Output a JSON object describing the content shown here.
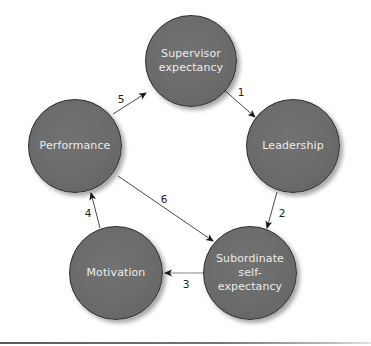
{
  "diagram": {
    "nodes": [
      {
        "id": "supervisor",
        "label": "Supervisor expectancy",
        "cx": 191,
        "cy": 61,
        "r": 46
      },
      {
        "id": "leadership",
        "label": "Leadership",
        "cx": 293,
        "cy": 146,
        "r": 47
      },
      {
        "id": "subordinate",
        "label": "Subordinate self-expectancy",
        "cx": 250,
        "cy": 273,
        "r": 47
      },
      {
        "id": "motivation",
        "label": "Motivation",
        "cx": 116,
        "cy": 273,
        "r": 47
      },
      {
        "id": "performance",
        "label": "Performance",
        "cx": 75,
        "cy": 146,
        "r": 47
      }
    ],
    "edges": [
      {
        "label": "1",
        "from": "supervisor",
        "to": "leadership",
        "x1": 222,
        "y1": 88,
        "x2": 255,
        "y2": 117,
        "lx": 241,
        "ly": 92
      },
      {
        "label": "2",
        "from": "leadership",
        "to": "subordinate",
        "x1": 277,
        "y1": 192,
        "x2": 267,
        "y2": 228,
        "lx": 282,
        "ly": 213
      },
      {
        "label": "3",
        "from": "subordinate",
        "to": "motivation",
        "x1": 203,
        "y1": 273,
        "x2": 165,
        "y2": 273,
        "lx": 186,
        "ly": 283
      },
      {
        "label": "4",
        "from": "motivation",
        "to": "performance",
        "x1": 100,
        "y1": 228,
        "x2": 91,
        "y2": 193,
        "lx": 88,
        "ly": 213
      },
      {
        "label": "5",
        "from": "performance",
        "to": "supervisor",
        "x1": 113,
        "y1": 114,
        "x2": 146,
        "y2": 93,
        "lx": 121,
        "ly": 99
      },
      {
        "label": "6",
        "from": "performance",
        "to": "subordinate",
        "x1": 118,
        "y1": 176,
        "x2": 213,
        "y2": 241,
        "lx": 164,
        "ly": 199
      }
    ],
    "colors": {
      "node_fill": "#6a6a6a",
      "node_border": "#2e2e2e",
      "node_text": "#ececec",
      "edge": "#222222"
    }
  },
  "labels": {
    "supervisor_line1": "Supervisor",
    "supervisor_line2": "expectancy",
    "leadership": "Leadership",
    "subordinate_line1": "Subordinate self-",
    "subordinate_line2": "expectancy",
    "motivation": "Motivation",
    "performance": "Performance",
    "edge1": "1",
    "edge2": "2",
    "edge3": "3",
    "edge4": "4",
    "edge5": "5",
    "edge6": "6"
  }
}
